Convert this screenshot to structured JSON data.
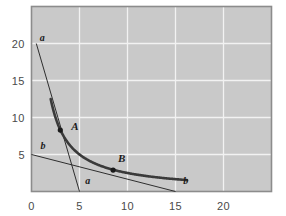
{
  "chart_data": {
    "type": "line",
    "title": "",
    "xlabel": "",
    "ylabel": "",
    "xlim": [
      0,
      25
    ],
    "ylim": [
      0,
      25
    ],
    "grid": true,
    "legend": "none",
    "plot_background": "#c9c9c9",
    "grid_color": "#f2f2f2",
    "frame_color": "#8c8c8c",
    "curve_color": "#3a3a3a",
    "tangent_color": "#2e2e2e",
    "point_color": "#1a1a1a",
    "x_ticks": [
      {
        "value": 0,
        "label": "0"
      },
      {
        "value": 5,
        "label": "5"
      },
      {
        "value": 10,
        "label": "10"
      },
      {
        "value": 15,
        "label": "15"
      },
      {
        "value": 20,
        "label": "20"
      }
    ],
    "y_ticks": [
      {
        "value": 5,
        "label": "5"
      },
      {
        "value": 10,
        "label": "10"
      },
      {
        "value": 15,
        "label": "15"
      },
      {
        "value": 20,
        "label": "20"
      }
    ],
    "series": [
      {
        "name": "curve",
        "kind": "hyperbola",
        "equation": "x*y = 25",
        "x_start": 2.0,
        "x_end": 16.2,
        "points": [
          {
            "x": 2.0,
            "y": 18.0
          },
          {
            "x": 2.3,
            "y": 14.6
          },
          {
            "x": 2.6,
            "y": 12.2
          },
          {
            "x": 3.0,
            "y": 8.3
          },
          {
            "x": 3.5,
            "y": 7.1
          },
          {
            "x": 4.0,
            "y": 6.2
          },
          {
            "x": 5.0,
            "y": 5.0
          },
          {
            "x": 6.0,
            "y": 4.2
          },
          {
            "x": 7.0,
            "y": 3.6
          },
          {
            "x": 8.5,
            "y": 2.9
          },
          {
            "x": 10.0,
            "y": 2.5
          },
          {
            "x": 12.0,
            "y": 2.1
          },
          {
            "x": 14.0,
            "y": 1.8
          },
          {
            "x": 16.2,
            "y": 1.7
          }
        ]
      },
      {
        "name": "tangent-a",
        "kind": "line",
        "label": "a",
        "from": {
          "x": 0.5,
          "y": 20.0
        },
        "to": {
          "x": 5.0,
          "y": 0.0
        },
        "tangent_at": "A"
      },
      {
        "name": "tangent-b",
        "kind": "line",
        "label": "b",
        "from": {
          "x": 0.0,
          "y": 5.0
        },
        "to": {
          "x": 15.0,
          "y": 0.0
        },
        "tangent_at": "B"
      }
    ],
    "points": [
      {
        "label": "A",
        "x": 3.0,
        "y": 8.3,
        "label_dx": 11,
        "label_dy": -4
      },
      {
        "label": "B",
        "x": 8.5,
        "y": 2.9,
        "label_dx": 5,
        "label_dy": -12
      }
    ],
    "line_labels": [
      {
        "text": "a",
        "x": 0.85,
        "y": 20.7
      },
      {
        "text": "a",
        "x": 5.6,
        "y": 1.4
      },
      {
        "text": "b",
        "x": 0.95,
        "y": 6.1
      },
      {
        "text": "b",
        "x": 15.8,
        "y": 1.4
      }
    ]
  }
}
